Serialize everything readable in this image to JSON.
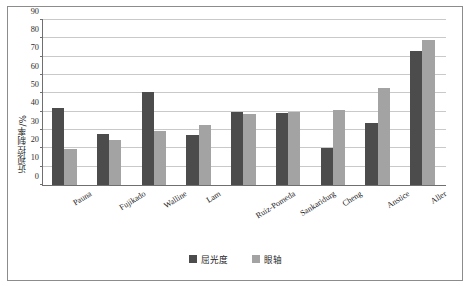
{
  "chart_data": {
    "type": "bar",
    "title": "",
    "xlabel": "",
    "ylabel": "近视控制率/%",
    "ylim": [
      0,
      90
    ],
    "yticks": [
      0,
      10,
      20,
      30,
      40,
      50,
      60,
      70,
      80,
      90
    ],
    "grid": true,
    "legend_position": "bottom",
    "categories": [
      "Pauna",
      "Fujikado",
      "Walline",
      "Lam",
      "Ruiz-Pomeda",
      "Sankaridurg",
      "Cheng",
      "Anstice",
      "Aller"
    ],
    "series": [
      {
        "name": "屈光度",
        "color": "#4c4c4c",
        "values": [
          42,
          28,
          51,
          27.5,
          40,
          39.5,
          20,
          34,
          73
        ]
      },
      {
        "name": "眼轴",
        "color": "#a3a3a3",
        "values": [
          19.5,
          24.5,
          29.5,
          33,
          39,
          40,
          41,
          53,
          79
        ]
      }
    ]
  }
}
